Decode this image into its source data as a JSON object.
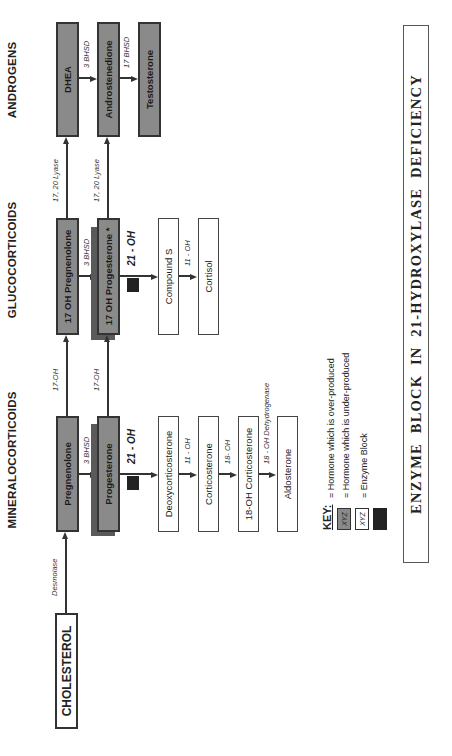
{
  "headings": {
    "mineralocorticoids": "MINERALOCORTICOIDS",
    "glucocorticoids": "GLUCOCORTICOIDS",
    "androgens": "ANDROGENS"
  },
  "nodes": {
    "cholesterol": "CHOLESTEROL",
    "pregnenolone": "Pregnenolone",
    "oh17_pregnenolone": "17 OH Pregnenolone",
    "dhea": "DHEA",
    "progesterone": "Progesterone",
    "oh17_progesterone": "17 OH Progesterone *",
    "androstenedione": "Androstenedione",
    "testosterone": "Testosterone",
    "deoxycorticosterone": "Deoxycorticosterone",
    "corticosterone": "Corticosterone",
    "oh18_corticosterone": "18-OH Corticosterone",
    "aldosterone": "Aldosterone",
    "compound_s": "Compound S",
    "cortisol": "Cortisol"
  },
  "enzymes": {
    "desmolase": "Desmolase",
    "oh17_a": "17-OH",
    "oh17_b": "17-OH",
    "lyase_a": "17, 20 Lyase",
    "lyase_b": "17, 20 Lyase",
    "bhsd3_a": "3 BHSD",
    "bhsd3_b": "3 BHSD",
    "bhsd3_c": "3 BHSD",
    "bhsd17": "17 BHSD",
    "oh21_a": "21 - OH",
    "oh21_b": "21 - OH",
    "oh11_a": "11 - OH",
    "oh11_b": "11 - OH",
    "oh18": "18- OH",
    "oh18_dehydrogenase": "18 - OH Dehydrogenase"
  },
  "key": {
    "title": "KEY:",
    "swatch_text": "XYZ",
    "items": [
      {
        "swatch": "dark",
        "label": "=  Hormone which is over-produced"
      },
      {
        "swatch": "white",
        "label": "=  Hormone which is under-produced"
      },
      {
        "swatch": "block",
        "label": "=  Enzyme Block"
      }
    ]
  },
  "title": "ENZYME BLOCK IN 21-HYDROXYLASE DEFICIENCY",
  "colors": {
    "overproduced": "#8a8a8a",
    "underproduced": "#ffffff",
    "enzyme_block": "#222222",
    "shadow": "#5a5a5a"
  }
}
